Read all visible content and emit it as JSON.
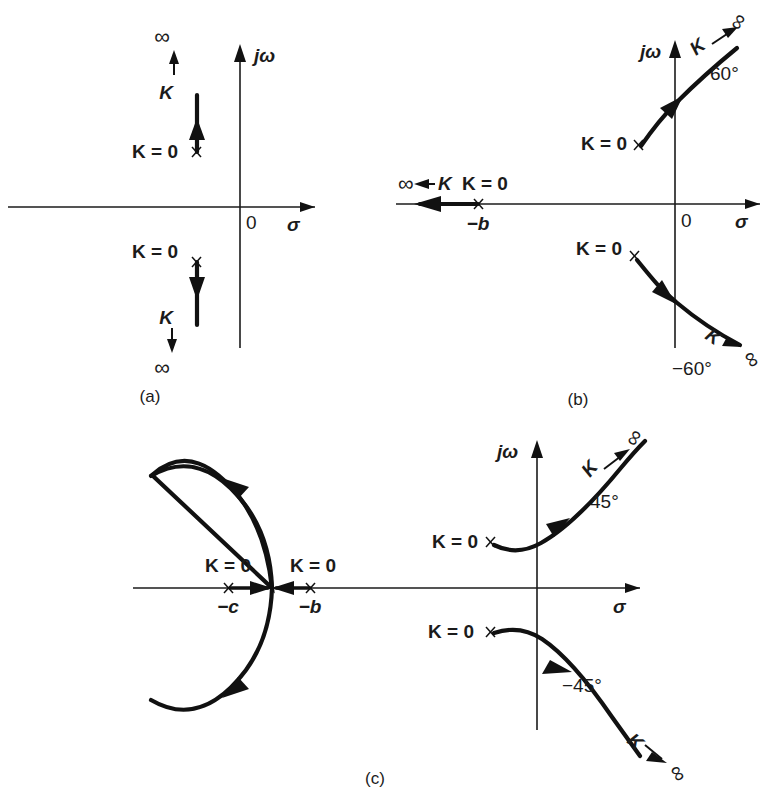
{
  "figure": {
    "background_color": "#ffffff",
    "ink_color": "#1b1b1b",
    "width": 766,
    "height": 795
  },
  "panels": [
    {
      "id": "a",
      "caption": "(a)",
      "axis_labels": {
        "imag": "jω",
        "real": "σ",
        "origin": "0"
      },
      "poles": [
        {
          "marker": "x",
          "label": "K = 0",
          "x": 197,
          "y": 152
        },
        {
          "marker": "x",
          "label": "K = 0",
          "x": 197,
          "y": 262
        }
      ],
      "branch_labels": [
        {
          "text": "K",
          "x": 172,
          "y": 92
        },
        {
          "text": "∞",
          "x": 170,
          "y": 36
        },
        {
          "text": "K",
          "x": 170,
          "y": 318
        },
        {
          "text": "∞",
          "x": 170,
          "y": 368
        }
      ]
    },
    {
      "id": "b",
      "caption": "(b)",
      "axis_labels": {
        "imag": "jω",
        "real": "σ",
        "origin": "0"
      },
      "poles": [
        {
          "marker": "x",
          "label": "K = 0",
          "x": 638,
          "y": 144
        },
        {
          "marker": "x",
          "label": "K = 0",
          "x": 478,
          "y": 204,
          "pole_name": "−b"
        },
        {
          "marker": "x",
          "label": "K = 0",
          "x": 634,
          "y": 256
        }
      ],
      "asymptote_angles": [
        "60°",
        "−60°"
      ],
      "branch_labels": [
        {
          "text": "K",
          "x": 700,
          "y": 50
        },
        {
          "text": "∞",
          "x": 747,
          "y": 26
        },
        {
          "text": "K",
          "x": 708,
          "y": 342
        },
        {
          "text": "∞",
          "x": 748,
          "y": 350
        },
        {
          "text": "K",
          "x": 440,
          "y": 190
        },
        {
          "text": "∞",
          "x": 405,
          "y": 190
        }
      ]
    },
    {
      "id": "c",
      "caption": "(c)",
      "axis_labels": {
        "imag": "jω",
        "real": "σ",
        "origin": ""
      },
      "poles": [
        {
          "marker": "x",
          "label": "K = 0",
          "x": 228,
          "y": 588,
          "pole_name": "−c"
        },
        {
          "marker": "x",
          "label": "K = 0",
          "x": 310,
          "y": 588,
          "pole_name": "−b"
        },
        {
          "marker": "x",
          "label": "K = 0",
          "x": 490,
          "y": 542
        },
        {
          "marker": "x",
          "label": "K = 0",
          "x": 490,
          "y": 631
        }
      ],
      "asymptote_angles": [
        "45°",
        "−45°"
      ],
      "branch_labels": [
        {
          "text": "K",
          "x": 594,
          "y": 470
        },
        {
          "text": "∞",
          "x": 640,
          "y": 442
        },
        {
          "text": "K",
          "x": 630,
          "y": 735
        },
        {
          "text": "∞",
          "x": 673,
          "y": 765
        }
      ]
    }
  ],
  "text": {
    "k_zero": "K = 0",
    "k": "K",
    "infinity": "∞",
    "sigma": "σ",
    "jomega": "jω",
    "origin_zero": "0",
    "pole_b": "−b",
    "pole_c": "−c",
    "angle_60": "60°",
    "angle_minus_60": "−60°",
    "angle_45": "45°",
    "angle_minus_45": "−45°",
    "caption_a": "(a)",
    "caption_b": "(b)",
    "caption_c": "(c)"
  }
}
